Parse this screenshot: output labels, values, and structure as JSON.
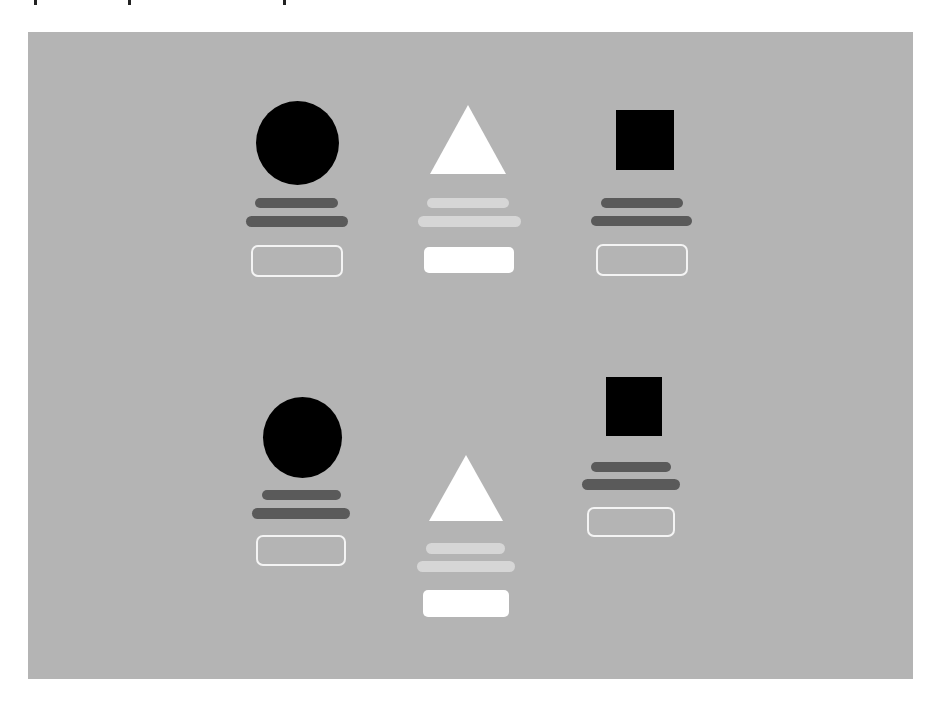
{
  "panel": {
    "background": "#b4b4b4"
  },
  "colors": {
    "icon_dark": "#000000",
    "icon_light": "#ffffff",
    "bar_dark": "#5a5a5a",
    "bar_light": "#d6d6d6",
    "button_outline": "#f4f4f4",
    "button_filled": "#ffffff"
  },
  "cards": [
    {
      "icon": "circle-icon",
      "variant": "outline",
      "bars": 2,
      "button": "outline"
    },
    {
      "icon": "triangle-icon",
      "variant": "filled",
      "bars": 2,
      "button": "filled"
    },
    {
      "icon": "square-icon",
      "variant": "outline",
      "bars": 2,
      "button": "outline"
    },
    {
      "icon": "circle-icon",
      "variant": "outline",
      "bars": 2,
      "button": "outline"
    },
    {
      "icon": "triangle-icon",
      "variant": "filled",
      "bars": 2,
      "button": "filled"
    },
    {
      "icon": "square-icon",
      "variant": "outline",
      "bars": 2,
      "button": "outline"
    }
  ]
}
